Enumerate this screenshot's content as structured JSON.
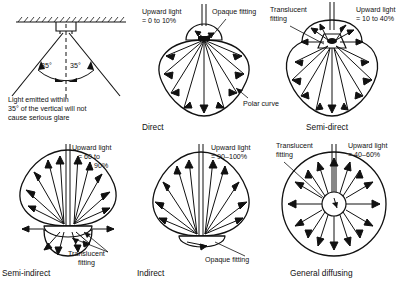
{
  "figure": {
    "type": "lighting-distribution-diagram",
    "panel_count": 6,
    "line_color": "#111111",
    "background": "#ffffff"
  },
  "panels": [
    {
      "id": "glare-angle",
      "caption": "",
      "note_lines": [
        "Light emitted within",
        "35° of the vertical will not",
        "cause serious glare"
      ],
      "angle_left": "35°",
      "angle_right": "35°",
      "ceiling": "hatched-ceiling",
      "fitting": "opaque-fitting"
    },
    {
      "id": "direct",
      "caption": "Direct",
      "upward_light_lines": [
        "Upward light",
        "= 0 to 10%"
      ],
      "fitting_label": "Opaque fitting",
      "curve_label": "Polar curve",
      "fitting_type": "opaque",
      "upward_percent_min": 0,
      "upward_percent_max": 10
    },
    {
      "id": "semi-direct",
      "caption": "Semi-direct",
      "upward_light_lines": [
        "Upward light",
        "= 10 to 40%"
      ],
      "fitting_label_lines": [
        "Translucent",
        "fitting"
      ],
      "fitting_type": "translucent",
      "upward_percent_min": 10,
      "upward_percent_max": 40
    },
    {
      "id": "semi-indirect",
      "caption": "Semi-indirect",
      "upward_light_lines": [
        "Upward light",
        "= 60 to",
        "90%"
      ],
      "fitting_label_lines": [
        "Translucent",
        "fitting"
      ],
      "fitting_type": "translucent",
      "upward_percent_min": 60,
      "upward_percent_max": 90
    },
    {
      "id": "indirect",
      "caption": "Indirect",
      "upward_light_lines": [
        "Upward light",
        "= 90–100%"
      ],
      "fitting_label": "Opaque fitting",
      "fitting_type": "opaque",
      "upward_percent_min": 90,
      "upward_percent_max": 100
    },
    {
      "id": "general-diffusing",
      "caption": "General diffusing",
      "upward_light_lines": [
        "Upward light",
        "= 40–60%"
      ],
      "fitting_label_lines": [
        "Translucent",
        "fitting"
      ],
      "fitting_type": "translucent",
      "upward_percent_min": 40,
      "upward_percent_max": 60
    }
  ]
}
